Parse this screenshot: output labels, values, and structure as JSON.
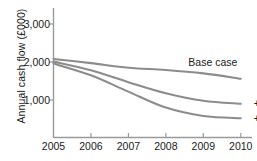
{
  "chart_data": {
    "type": "line",
    "title": "",
    "xlabel": "",
    "ylabel": "Annual cash flow (£000)",
    "x": [
      2005,
      2006,
      2007,
      2008,
      2009,
      2010
    ],
    "xlim": [
      2005,
      2010.3
    ],
    "ylim": [
      0,
      3400
    ],
    "yticks": [
      1000,
      2000,
      3000
    ],
    "ytick_labels": [
      "1,000",
      "2,000",
      "3,000"
    ],
    "xtick_labels": [
      "2005",
      "2006",
      "2007",
      "2008",
      "2009",
      "2010"
    ],
    "grid": false,
    "legend_position": "inline-right",
    "line_color": "#8c8c8c",
    "axis_color": "#9a9a9a",
    "text_color": "#1a1a1a",
    "series": [
      {
        "name": "Base case",
        "label": "Base case",
        "values": [
          2080,
          1970,
          1850,
          1790,
          1700,
          1560
        ]
      },
      {
        "name": "+2%",
        "label": "+2%",
        "values": [
          2010,
          1780,
          1470,
          1180,
          980,
          900
        ]
      },
      {
        "name": "+3%",
        "label": "+3%",
        "values": [
          1960,
          1650,
          1220,
          800,
          580,
          520
        ]
      }
    ],
    "annotations": [
      {
        "text": "Base case",
        "x": 2008.6,
        "y": 2000
      },
      {
        "text": "+2%",
        "x": 2010.35,
        "y": 900
      },
      {
        "text": "+3%",
        "x": 2010.35,
        "y": 520
      }
    ]
  }
}
